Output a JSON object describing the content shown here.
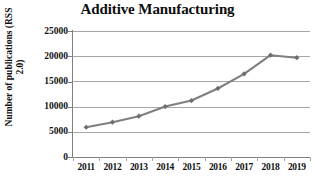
{
  "chart_data": {
    "type": "line",
    "title": "Additive Manufacturing",
    "xlabel": "",
    "ylabel": "Number of publications (RSS 2.0)",
    "categories": [
      "2011",
      "2012",
      "2013",
      "2014",
      "2015",
      "2016",
      "2017",
      "2018",
      "2019"
    ],
    "values": [
      5900,
      6900,
      8100,
      10000,
      11200,
      13600,
      16500,
      20200,
      19700
    ],
    "series": [
      {
        "name": "Number of publications (RSS 2.0)",
        "values": [
          5900,
          6900,
          8100,
          10000,
          11200,
          13600,
          16500,
          20200,
          19700
        ]
      }
    ],
    "ylim": [
      0,
      25000
    ],
    "y_ticks": [
      0,
      5000,
      10000,
      15000,
      20000,
      25000
    ],
    "y_tick_labels": [
      "0",
      "5000",
      "10000",
      "15000",
      "20000",
      "25000"
    ],
    "grid": "horizontal",
    "legend": "none",
    "line_color": "#7f7f7f",
    "marker": "diamond",
    "marker_color": "#6e6e6e",
    "grid_color": "#a6a6a6",
    "axis_color": "#808080",
    "background": "#ffffff"
  },
  "title": {
    "text": "Additive Manufacturing"
  },
  "axes": {
    "y_title_line1": "Number of publications (RSS",
    "y_title_line2": "2.0)",
    "y_labels": [
      "25000",
      "20000",
      "15000",
      "10000",
      "5000",
      "0"
    ],
    "x_labels": [
      "2011",
      "2012",
      "2013",
      "2014",
      "2015",
      "2016",
      "2017",
      "2018",
      "2019"
    ]
  }
}
